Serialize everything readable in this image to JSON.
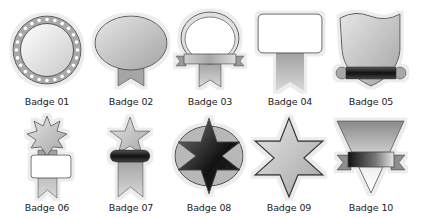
{
  "colors": {
    "background": "#ffffff",
    "outline": "#4a4a4a",
    "light_gray": "#e4e4e4",
    "mid_gray": "#a8a8a8",
    "dark": "#1e1e1e",
    "halo": "#f2f2f2"
  },
  "badges": [
    {
      "id": "01",
      "label": "Badge 01",
      "shape": "studded-circle"
    },
    {
      "id": "02",
      "label": "Badge 02",
      "shape": "oval-with-ribbon"
    },
    {
      "id": "03",
      "label": "Badge 03",
      "shape": "oval-frame-with-banner"
    },
    {
      "id": "04",
      "label": "Badge 04",
      "shape": "rectangle-with-ribbon"
    },
    {
      "id": "05",
      "label": "Badge 05",
      "shape": "shield-with-scroll"
    },
    {
      "id": "06",
      "label": "Badge 06",
      "shape": "starburst-with-plaque"
    },
    {
      "id": "07",
      "label": "Badge 07",
      "shape": "star-with-band"
    },
    {
      "id": "08",
      "label": "Badge 08",
      "shape": "hexagram-in-oval"
    },
    {
      "id": "09",
      "label": "Badge 09",
      "shape": "hexagram"
    },
    {
      "id": "10",
      "label": "Badge 10",
      "shape": "inverted-triangle-with-banner"
    }
  ]
}
